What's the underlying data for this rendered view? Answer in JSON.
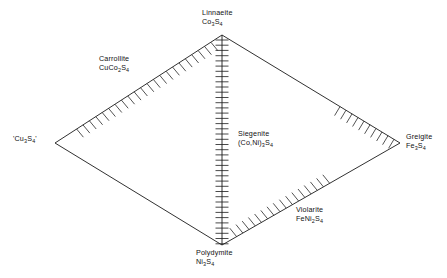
{
  "figure": {
    "type": "ternary-quaternary-phase-diagram",
    "shape": "rhombus",
    "stroke_color": "#1a1a1a",
    "background_color": "#ffffff"
  },
  "vertices": [
    {
      "id": "linnaeite",
      "position": "top",
      "name": "Linnaeite",
      "formula_parts": [
        {
          "text": "Co",
          "sub": false
        },
        {
          "text": "3",
          "sub": true
        },
        {
          "text": "S",
          "sub": false
        },
        {
          "text": "4",
          "sub": true
        }
      ],
      "formula_plain": "Co3S4",
      "x": 222,
      "y": 35
    },
    {
      "id": "cu3s4",
      "position": "left",
      "name": "'Cu",
      "formula_parts": [
        {
          "text": "'Cu",
          "sub": false
        },
        {
          "text": "3",
          "sub": true
        },
        {
          "text": "S",
          "sub": false
        },
        {
          "text": "4",
          "sub": true
        },
        {
          "text": "'",
          "sub": false
        }
      ],
      "formula_plain": "'Cu3S4'",
      "x": 55,
      "y": 143
    },
    {
      "id": "greigite",
      "position": "right",
      "name": "Greigite",
      "formula_parts": [
        {
          "text": "Fe",
          "sub": false
        },
        {
          "text": "3",
          "sub": true
        },
        {
          "text": "S",
          "sub": false
        },
        {
          "text": "4",
          "sub": true
        }
      ],
      "formula_plain": "Fe3S4",
      "x": 400,
      "y": 143
    },
    {
      "id": "polydymite",
      "position": "bottom",
      "name": "Polydymite",
      "formula_parts": [
        {
          "text": "Ni",
          "sub": false
        },
        {
          "text": "3",
          "sub": true
        },
        {
          "text": "S",
          "sub": false
        },
        {
          "text": "4",
          "sub": true
        }
      ],
      "formula_plain": "Ni3S4",
      "x": 222,
      "y": 245
    }
  ],
  "interior_labels": [
    {
      "id": "carrollite",
      "name": "Carrollite",
      "formula_parts": [
        {
          "text": "CuCo",
          "sub": false
        },
        {
          "text": "2",
          "sub": true
        },
        {
          "text": "S",
          "sub": false
        },
        {
          "text": "4",
          "sub": true
        }
      ],
      "formula_plain": "CuCo2S4",
      "on_edge": "upper-left"
    },
    {
      "id": "siegenite",
      "name": "Siegenite",
      "formula_parts": [
        {
          "text": "(Co,Ni)",
          "sub": false
        },
        {
          "text": "3",
          "sub": true
        },
        {
          "text": "S",
          "sub": false
        },
        {
          "text": "4",
          "sub": true
        }
      ],
      "formula_plain": "(Co,Ni)3S4",
      "on_edge": "vertical-center-join"
    },
    {
      "id": "violarite",
      "name": "Violarite",
      "formula_parts": [
        {
          "text": "FeNi",
          "sub": false
        },
        {
          "text": "2",
          "sub": true
        },
        {
          "text": "S",
          "sub": false
        },
        {
          "text": "4",
          "sub": true
        }
      ],
      "formula_plain": "FeNi2S4",
      "on_edge": "lower-right"
    }
  ],
  "hatched_edges": [
    {
      "id": "hatch-upper-left",
      "from": "cu3s4",
      "to": "linnaeite",
      "note": "Carrollite solid-solution field"
    },
    {
      "id": "hatch-lower-right",
      "from": "polydymite",
      "to": "greigite",
      "note": "Violarite solid-solution field"
    },
    {
      "id": "hatch-upper-right-partial",
      "from": "greigite",
      "to": "linnaeite",
      "note": "partial hatch toward Greigite"
    }
  ],
  "center_line": {
    "id": "siegenite-join",
    "from": "linnaeite",
    "to": "polydymite",
    "style": "tick-marked",
    "tick_count": 40
  }
}
